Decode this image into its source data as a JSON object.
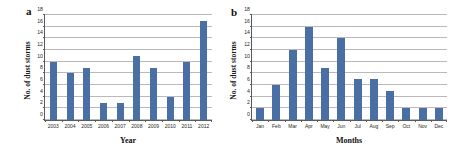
{
  "figure": {
    "panels": [
      {
        "letter": "a",
        "ylabel": "No. of dust storms",
        "xlabel": "Year"
      },
      {
        "letter": "b",
        "ylabel": "No. of dust storms",
        "xlabel": "Months"
      }
    ],
    "bar_color": "#4a6fa5",
    "grid_color": "#b9b9b9",
    "axis_color": "#5a5a5a"
  },
  "chart_data": [
    {
      "type": "bar",
      "panel": "a",
      "title": "",
      "xlabel": "Year",
      "ylabel": "No. of dust storms",
      "categories": [
        "2003",
        "2004",
        "2005",
        "2006",
        "2007",
        "2008",
        "2009",
        "2010",
        "2011",
        "2012"
      ],
      "values": [
        10,
        8,
        9,
        3,
        3,
        11,
        9,
        4,
        10,
        17
      ],
      "ylim": [
        0,
        18
      ],
      "yticks": [
        0,
        2,
        4,
        6,
        8,
        10,
        12,
        14,
        16,
        18
      ],
      "grid": true,
      "legend": "none",
      "series_name": "No. of dust storms"
    },
    {
      "type": "bar",
      "panel": "b",
      "title": "",
      "xlabel": "Months",
      "ylabel": "No. of dust storms",
      "categories": [
        "Jan",
        "Feb",
        "Mar",
        "Apr",
        "May",
        "Jun",
        "Jul",
        "Aug",
        "Sep",
        "Oct",
        "Nov",
        "Dec"
      ],
      "values": [
        2,
        6,
        12,
        16,
        9,
        14,
        7,
        7,
        5,
        2,
        2,
        2
      ],
      "ylim": [
        0,
        18
      ],
      "yticks": [
        0,
        2,
        4,
        6,
        8,
        10,
        12,
        14,
        16,
        18
      ],
      "grid": true,
      "legend": "none",
      "series_name": "No. of dust storms"
    }
  ]
}
